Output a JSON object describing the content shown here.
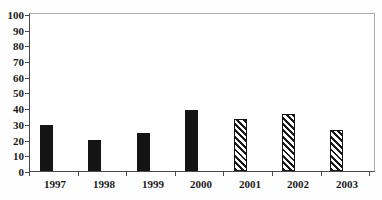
{
  "chart_data": {
    "type": "bar",
    "title": "",
    "xlabel": "",
    "ylabel": "",
    "categories": [
      "1997",
      "1998",
      "1999",
      "2000",
      "2001",
      "2002",
      "2003"
    ],
    "values": [
      29,
      20,
      24,
      39,
      33,
      36,
      26
    ],
    "fills": [
      "solid",
      "solid",
      "solid",
      "solid",
      "hatch",
      "hatch",
      "hatch"
    ],
    "series": [
      {
        "name": "solid-black-bars",
        "fill": "solid",
        "values": [
          29,
          20,
          24,
          39,
          null,
          null,
          null
        ]
      },
      {
        "name": "diagonal-hatch-bars",
        "fill": "hatch",
        "values": [
          null,
          null,
          null,
          null,
          33,
          36,
          26
        ]
      }
    ],
    "ylim": [
      0,
      100
    ],
    "y_ticks": [
      0,
      10,
      20,
      30,
      40,
      50,
      60,
      70,
      80,
      90,
      100
    ],
    "grid": false,
    "legend": "none"
  },
  "colors": {
    "background": "#fefefe",
    "bar_solid": "#141414",
    "hatch_stripe": "#1a1a1a",
    "axis_line": "#4a4a4a",
    "frame_line": "#ababab",
    "text": "#1a1a1a"
  }
}
